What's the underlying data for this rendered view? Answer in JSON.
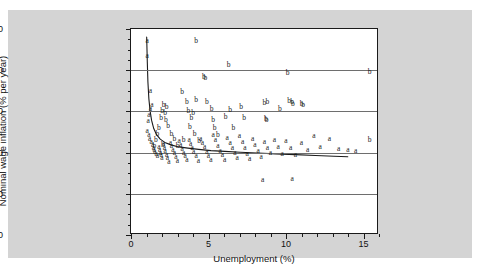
{
  "chart_data": {
    "type": "scatter",
    "title": "",
    "xlabel": "Unemployment (%)",
    "ylabel": "Nominal wage inflation (% per year)",
    "xlim": [
      0,
      16
    ],
    "ylim": [
      -20,
      30
    ],
    "xticks": [
      0,
      5,
      10,
      15
    ],
    "yticks": [
      30,
      20,
      10,
      0,
      -10,
      -20
    ],
    "xtick_labels": [
      "0",
      "5",
      "10",
      "15"
    ],
    "ytick_labels": [
      "30",
      "20",
      "10",
      "0",
      "-10",
      "-20"
    ],
    "grid": "horizontal",
    "gridlines_y": [
      20,
      10,
      0,
      -10
    ],
    "legend": "none",
    "marker_style": "letter-glyphs",
    "series": [
      {
        "name": "a",
        "label": "a",
        "points": [
          [
            1.05,
            27.0
          ],
          [
            1.05,
            23.5
          ],
          [
            1.25,
            15.0
          ],
          [
            1.35,
            11.6
          ],
          [
            1.25,
            10.6
          ],
          [
            1.15,
            9.2
          ],
          [
            1.1,
            7.6
          ],
          [
            1.05,
            5.2
          ],
          [
            1.15,
            4.3
          ],
          [
            1.2,
            3.4
          ],
          [
            1.3,
            2.6
          ],
          [
            1.4,
            1.9
          ],
          [
            1.45,
            1.2
          ],
          [
            1.5,
            0.6
          ],
          [
            1.55,
            0.1
          ],
          [
            1.62,
            -0.4
          ],
          [
            1.7,
            -0.9
          ],
          [
            1.8,
            1.4
          ],
          [
            1.85,
            0.7
          ],
          [
            1.9,
            0.0
          ],
          [
            1.95,
            -0.6
          ],
          [
            2.0,
            -1.3
          ],
          [
            2.1,
            2.0
          ],
          [
            2.15,
            1.1
          ],
          [
            2.2,
            0.3
          ],
          [
            2.3,
            -0.5
          ],
          [
            2.35,
            -1.4
          ],
          [
            2.45,
            -2.3
          ],
          [
            2.55,
            2.4
          ],
          [
            2.6,
            1.5
          ],
          [
            2.7,
            0.6
          ],
          [
            2.8,
            -0.2
          ],
          [
            2.9,
            -1.1
          ],
          [
            3.0,
            -2.0
          ],
          [
            3.1,
            2.8
          ],
          [
            3.2,
            1.8
          ],
          [
            3.3,
            0.9
          ],
          [
            3.4,
            0.0
          ],
          [
            3.5,
            -0.9
          ],
          [
            3.6,
            -1.9
          ],
          [
            3.75,
            3.1
          ],
          [
            3.85,
            2.1
          ],
          [
            3.95,
            1.0
          ],
          [
            4.05,
            0.1
          ],
          [
            4.2,
            -0.9
          ],
          [
            4.35,
            -2.0
          ],
          [
            4.5,
            3.4
          ],
          [
            4.6,
            2.3
          ],
          [
            4.75,
            1.3
          ],
          [
            4.9,
            0.2
          ],
          [
            5.0,
            -0.8
          ],
          [
            5.15,
            -1.8
          ],
          [
            5.3,
            4.2
          ],
          [
            5.45,
            3.0
          ],
          [
            5.6,
            1.7
          ],
          [
            5.75,
            0.5
          ],
          [
            5.9,
            -0.6
          ],
          [
            6.05,
            -1.7
          ],
          [
            6.2,
            3.6
          ],
          [
            6.4,
            2.4
          ],
          [
            6.55,
            1.0
          ],
          [
            6.7,
            -0.2
          ],
          [
            6.85,
            -1.4
          ],
          [
            7.0,
            4.0
          ],
          [
            7.2,
            2.6
          ],
          [
            7.35,
            1.1
          ],
          [
            7.5,
            -0.3
          ],
          [
            7.65,
            -1.6
          ],
          [
            7.85,
            3.2
          ],
          [
            8.0,
            1.8
          ],
          [
            8.2,
            0.4
          ],
          [
            8.4,
            -1.0
          ],
          [
            8.6,
            2.6
          ],
          [
            8.8,
            1.2
          ],
          [
            9.0,
            -0.2
          ],
          [
            9.25,
            3.0
          ],
          [
            9.5,
            1.3
          ],
          [
            9.75,
            -0.4
          ],
          [
            10.0,
            2.8
          ],
          [
            10.3,
            1.0
          ],
          [
            10.6,
            -0.6
          ],
          [
            11.0,
            2.4
          ],
          [
            11.4,
            0.6
          ],
          [
            11.8,
            4.0
          ],
          [
            12.2,
            1.4
          ],
          [
            12.8,
            3.4
          ],
          [
            13.4,
            0.8
          ],
          [
            14.0,
            0.6
          ],
          [
            14.5,
            0.5
          ],
          [
            8.5,
            -6.6
          ],
          [
            10.4,
            -6.4
          ]
        ]
      },
      {
        "name": "b",
        "label": "b",
        "points": [
          [
            4.2,
            27.0
          ],
          [
            6.3,
            21.2
          ],
          [
            4.7,
            18.4
          ],
          [
            4.8,
            18.0
          ],
          [
            10.1,
            19.4
          ],
          [
            3.3,
            14.6
          ],
          [
            4.2,
            12.8
          ],
          [
            3.6,
            12.4
          ],
          [
            4.9,
            12.2
          ],
          [
            2.1,
            11.6
          ],
          [
            2.3,
            11.0
          ],
          [
            8.6,
            12.0
          ],
          [
            8.8,
            12.3
          ],
          [
            10.2,
            12.5
          ],
          [
            10.4,
            12.2
          ],
          [
            10.45,
            11.8
          ],
          [
            11.0,
            11.9
          ],
          [
            11.1,
            11.6
          ],
          [
            2.0,
            10.0
          ],
          [
            2.2,
            9.6
          ],
          [
            3.7,
            10.2
          ],
          [
            4.0,
            9.6
          ],
          [
            5.2,
            10.6
          ],
          [
            6.4,
            10.4
          ],
          [
            7.1,
            11.0
          ],
          [
            9.6,
            10.6
          ],
          [
            1.95,
            8.3
          ],
          [
            2.25,
            8.0
          ],
          [
            3.9,
            8.4
          ],
          [
            5.3,
            8.0
          ],
          [
            6.1,
            8.6
          ],
          [
            7.3,
            8.3
          ],
          [
            8.7,
            8.2
          ],
          [
            8.75,
            7.8
          ],
          [
            1.8,
            6.0
          ],
          [
            2.4,
            6.4
          ],
          [
            3.8,
            6.2
          ],
          [
            5.4,
            6.0
          ],
          [
            6.6,
            5.9
          ],
          [
            1.7,
            4.4
          ],
          [
            2.6,
            4.6
          ],
          [
            4.1,
            4.4
          ],
          [
            5.6,
            4.2
          ],
          [
            1.6,
            3.0
          ],
          [
            2.8,
            3.2
          ],
          [
            3.4,
            3.0
          ],
          [
            4.4,
            2.8
          ],
          [
            1.5,
            1.6
          ],
          [
            2.05,
            1.8
          ],
          [
            3.0,
            1.5
          ],
          [
            15.4,
            3.0
          ],
          [
            15.4,
            19.6
          ]
        ]
      }
    ],
    "fit_curve": {
      "name": "fitted-phillips-curve",
      "points": [
        [
          1.02,
          28.0
        ],
        [
          1.06,
          22.0
        ],
        [
          1.1,
          17.0
        ],
        [
          1.16,
          13.0
        ],
        [
          1.24,
          10.0
        ],
        [
          1.34,
          7.6
        ],
        [
          1.48,
          5.6
        ],
        [
          1.66,
          4.1
        ],
        [
          1.9,
          3.0
        ],
        [
          2.2,
          2.2
        ],
        [
          2.6,
          1.6
        ],
        [
          3.1,
          1.1
        ],
        [
          3.7,
          0.8
        ],
        [
          4.4,
          0.5
        ],
        [
          5.2,
          0.2
        ],
        [
          6.1,
          0.0
        ],
        [
          7.1,
          -0.2
        ],
        [
          8.2,
          -0.4
        ],
        [
          9.4,
          -0.6
        ],
        [
          10.7,
          -0.8
        ],
        [
          12.0,
          -1.0
        ],
        [
          13.2,
          -1.2
        ],
        [
          14.1,
          -1.3
        ]
      ]
    },
    "colors": {
      "figure_background": "#d4d4d4",
      "page_background": "#ffffff",
      "plot_background": "#ffffff",
      "axis": "#1a1a1a",
      "gridline": "#6e6e6e",
      "marker": "#1a1a1a",
      "curve": "#1a1a1a"
    }
  }
}
